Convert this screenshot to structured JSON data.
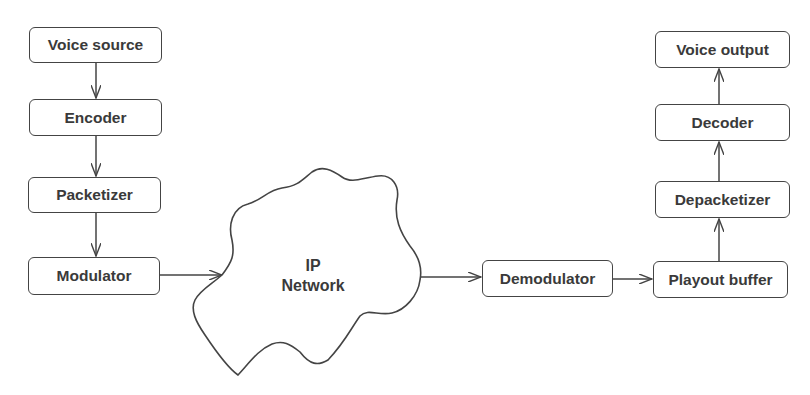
{
  "diagram": {
    "type": "flowchart",
    "sender_chain": [
      {
        "id": "voice_source",
        "label": "Voice source"
      },
      {
        "id": "encoder",
        "label": "Encoder"
      },
      {
        "id": "packetizer",
        "label": "Packetizer"
      },
      {
        "id": "modulator",
        "label": "Modulator"
      }
    ],
    "network": {
      "label_line1": "IP",
      "label_line2": "Network"
    },
    "receiver_chain": [
      {
        "id": "demodulator",
        "label": "Demodulator"
      },
      {
        "id": "playout_buffer",
        "label": "Playout buffer"
      },
      {
        "id": "depacketizer",
        "label": "Depacketizer"
      },
      {
        "id": "decoder",
        "label": "Decoder"
      },
      {
        "id": "voice_output",
        "label": "Voice output"
      }
    ],
    "edges": [
      [
        "Voice source",
        "Encoder"
      ],
      [
        "Encoder",
        "Packetizer"
      ],
      [
        "Packetizer",
        "Modulator"
      ],
      [
        "Modulator",
        "IP Network"
      ],
      [
        "IP Network",
        "Demodulator"
      ],
      [
        "Demodulator",
        "Playout buffer"
      ],
      [
        "Playout buffer",
        "Depacketizer"
      ],
      [
        "Depacketizer",
        "Decoder"
      ],
      [
        "Decoder",
        "Voice output"
      ]
    ],
    "colors": {
      "stroke": "#444444",
      "text": "#3a3a3a",
      "background": "#ffffff"
    }
  }
}
